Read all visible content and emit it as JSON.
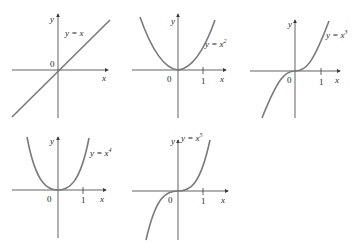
{
  "figure": {
    "panels": [
      {
        "id": "x1",
        "equation": "y = x",
        "y_axis_label": "y",
        "x_axis_label": "x",
        "origin_label": "0",
        "tick_label": ""
      },
      {
        "id": "x2",
        "equation": "y = x",
        "exponent": "2",
        "y_axis_label": "y",
        "x_axis_label": "x",
        "origin_label": "0",
        "tick_label": "1"
      },
      {
        "id": "x3",
        "equation": "y = x",
        "exponent": "3",
        "y_axis_label": "y",
        "x_axis_label": "x",
        "origin_label": "0",
        "tick_label": "1"
      },
      {
        "id": "x4",
        "equation": "y = x",
        "exponent": "4",
        "y_axis_label": "y",
        "x_axis_label": "x",
        "origin_label": "0",
        "tick_label": "1"
      },
      {
        "id": "x5",
        "equation": "y = x",
        "exponent": "5",
        "y_axis_label": "y",
        "x_axis_label": "x",
        "origin_label": "0",
        "tick_label": "1"
      }
    ],
    "colors": {
      "curve": "#7a7a7a",
      "axis": "#3a3a3a",
      "text": "#2a2a2a"
    }
  }
}
